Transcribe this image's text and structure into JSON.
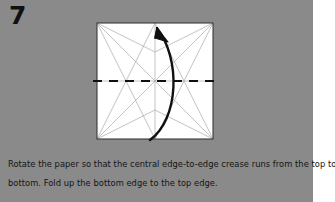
{
  "page": {
    "background_color": "#8a8a8a",
    "margin_color": "#ffffff",
    "panel_width": 313
  },
  "step": {
    "number": "7"
  },
  "caption": {
    "line1": "Rotate the paper so that the central edge-to-edge crease runs from the top to the",
    "line2": "bottom. Fold up the bottom edge to the top edge."
  },
  "diagram": {
    "paper_color": "#ffffff",
    "edge_color": "#3a3a3a",
    "crease_color": "#909090",
    "fold_line_color": "#101010",
    "arrow_color": "#101010",
    "square": {
      "x": 4,
      "y": 4,
      "size": 116
    },
    "valley_fold_label": "horizontal-center-dashed-crease",
    "arrow_label": "fold-up-bottom-to-top-arrow",
    "existing_creases": [
      "vertical-center",
      "diagonal-top-left-to-center-bottom",
      "diagonal-top-right-to-center-bottom",
      "diagonal-bottom-left-to-center-top",
      "diagonal-bottom-right-to-center-top",
      "top-left-to-center",
      "top-right-to-center",
      "bottom-left-to-center",
      "bottom-right-to-center",
      "top-left-to-upper-quarter-point",
      "top-right-to-upper-quarter-point",
      "bottom-left-to-lower-quarter-point",
      "bottom-right-to-lower-quarter-point",
      "left-edge-mid-to-center",
      "right-edge-mid-to-center"
    ]
  }
}
